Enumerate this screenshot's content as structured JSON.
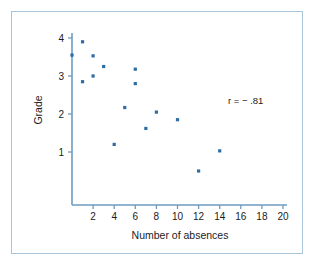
{
  "chart_data": {
    "type": "scatter",
    "title": "",
    "subtitle": "",
    "xlabel": "Number of absences",
    "ylabel": "Grade",
    "xlim": [
      0,
      20
    ],
    "ylim": [
      0,
      4.3
    ],
    "xticks": [
      2,
      4,
      6,
      8,
      10,
      12,
      14,
      16,
      18,
      20
    ],
    "xtick_labels": [
      "2",
      "4",
      "6",
      "8",
      "10",
      "12",
      "14",
      "16",
      "18",
      "20"
    ],
    "yticks": [
      1,
      2,
      3,
      4
    ],
    "ytick_labels": [
      "1",
      "2",
      "3",
      "4"
    ],
    "grid": false,
    "legend": null,
    "annotations": [
      {
        "name": "correlation",
        "text": "r = − .81",
        "x": 15.2,
        "y": 2.55
      }
    ],
    "series": [
      {
        "name": "students",
        "marker": "square",
        "color": "#2e6ca4",
        "points": [
          {
            "x": 0.0,
            "y": 3.55
          },
          {
            "x": 1.0,
            "y": 3.9
          },
          {
            "x": 1.0,
            "y": 2.85
          },
          {
            "x": 2.0,
            "y": 3.53
          },
          {
            "x": 2.0,
            "y": 3.0
          },
          {
            "x": 3.0,
            "y": 3.25
          },
          {
            "x": 4.0,
            "y": 1.2
          },
          {
            "x": 5.0,
            "y": 2.17
          },
          {
            "x": 6.0,
            "y": 3.18
          },
          {
            "x": 6.0,
            "y": 2.8
          },
          {
            "x": 7.0,
            "y": 1.62
          },
          {
            "x": 8.0,
            "y": 2.05
          },
          {
            "x": 10.0,
            "y": 1.85
          },
          {
            "x": 12.0,
            "y": 0.5
          },
          {
            "x": 14.0,
            "y": 1.03
          }
        ]
      }
    ]
  },
  "figure": {
    "frame_color": "#a8c4d8",
    "axis_color": "#6d9cc0",
    "marker_color": "#2e6ca4",
    "background": "#ffffff"
  }
}
